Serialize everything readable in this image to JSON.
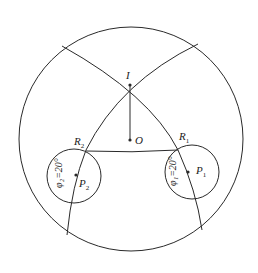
{
  "diagram": {
    "stroke_color": "#2a2a2a",
    "labels": {
      "I": "I",
      "O": "O",
      "R1": "R",
      "R1_sub": "1",
      "R2": "R",
      "R2_sub": "2",
      "P1": "P",
      "P1_sub": "1",
      "P2": "P",
      "P2_sub": "2",
      "phi1": "φ₁=20°",
      "phi2": "φ₂=20°"
    }
  }
}
